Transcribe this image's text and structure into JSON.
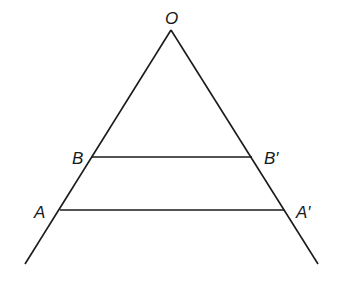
{
  "diagram": {
    "type": "geometry",
    "points": {
      "O": {
        "label": "O",
        "x": 171,
        "y": 30
      },
      "B": {
        "label": "B",
        "x": 92,
        "y": 157
      },
      "B_prime": {
        "label": "B′",
        "x": 252,
        "y": 157
      },
      "A": {
        "label": "A",
        "x": 60,
        "y": 210
      },
      "A_prime": {
        "label": "A′",
        "x": 284,
        "y": 210
      }
    },
    "segments": [
      {
        "name": "ray-left",
        "from": "O",
        "to": [
          25,
          264
        ]
      },
      {
        "name": "ray-right",
        "from": "O",
        "to": [
          318,
          264
        ]
      },
      {
        "name": "segment-BB'",
        "from": "B",
        "to": "B_prime"
      },
      {
        "name": "segment-AA'",
        "from": "A",
        "to": "A_prime"
      }
    ],
    "line_color": "#1a1a1a"
  }
}
